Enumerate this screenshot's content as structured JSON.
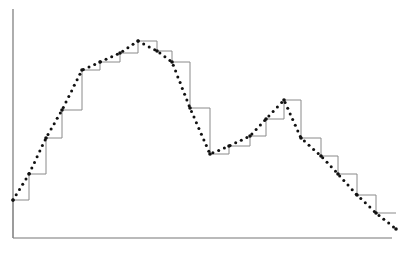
{
  "chart_data": {
    "type": "line",
    "title": "",
    "xlabel": "",
    "ylabel": "",
    "grid": false,
    "legend": null,
    "ylim": [
      0,
      100
    ],
    "xlim": [
      0,
      21
    ],
    "x": [
      0,
      1,
      2,
      3,
      4,
      5,
      6,
      7,
      8,
      9,
      10,
      11,
      12,
      13,
      14,
      15,
      16,
      17,
      18,
      19,
      20,
      21
    ],
    "series": [
      {
        "name": "dotted-line",
        "style": "dotted",
        "values": [
          17,
          28,
          44,
          56,
          73,
          77,
          81,
          86,
          82,
          77,
          57,
          37,
          40,
          45,
          52,
          60,
          44,
          36,
          28,
          19,
          11,
          4
        ]
      },
      {
        "name": "step-line",
        "style": "step-post",
        "values": [
          17,
          28,
          44,
          56,
          73,
          77,
          81,
          86,
          82,
          77,
          57,
          37,
          40,
          45,
          52,
          60,
          44,
          36,
          28,
          19,
          11,
          11
        ]
      }
    ],
    "pixel_points": [
      [
        13,
        200
      ],
      [
        29,
        174
      ],
      [
        46,
        138
      ],
      [
        62,
        110
      ],
      [
        82,
        70
      ],
      [
        100,
        62
      ],
      [
        120,
        53
      ],
      [
        138,
        41
      ],
      [
        157,
        51
      ],
      [
        172,
        62
      ],
      [
        190,
        108
      ],
      [
        210,
        154
      ],
      [
        229,
        146
      ],
      [
        250,
        136
      ],
      [
        266,
        119
      ],
      [
        284,
        100
      ],
      [
        301,
        138
      ],
      [
        321,
        156
      ],
      [
        338,
        174
      ],
      [
        357,
        195
      ],
      [
        376,
        213
      ],
      [
        396,
        229
      ]
    ],
    "axes": {
      "x_axis": {
        "x1": 13,
        "x2": 392,
        "y": 238
      },
      "y_axis": {
        "x": 13,
        "y1": 9,
        "y2": 238
      }
    },
    "colors": {
      "axis": "#777777",
      "step": "#8a8a8a",
      "dots": "#111111"
    }
  }
}
